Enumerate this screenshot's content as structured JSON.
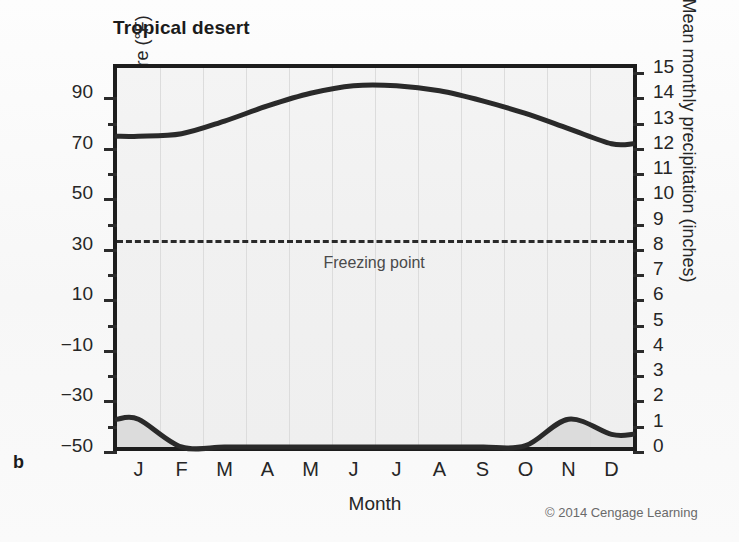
{
  "figure": {
    "panel_label": "b",
    "title": "Tropical desert",
    "copyright": "© 2014 Cengage Learning",
    "freezing_label": "Freezing point"
  },
  "chart_data": {
    "type": "line",
    "title": "Tropical desert",
    "xlabel": "Month",
    "ylabel": "Mean monthly temperature (°F)",
    "ylabel_right": "Mean monthly precipitation (inches)",
    "categories": [
      "J",
      "F",
      "M",
      "A",
      "M",
      "J",
      "J",
      "A",
      "S",
      "O",
      "N",
      "D"
    ],
    "month_names": [
      "January",
      "February",
      "March",
      "April",
      "May",
      "June",
      "July",
      "August",
      "September",
      "October",
      "November",
      "December"
    ],
    "ylim": [
      -50,
      100
    ],
    "yticks_left": [
      90,
      70,
      50,
      30,
      10,
      -10,
      -30,
      -50
    ],
    "yticks_left_all": [
      90,
      80,
      70,
      60,
      50,
      40,
      30,
      20,
      10,
      0,
      -10,
      -20,
      -30,
      -40,
      -50
    ],
    "ylim_right": [
      0,
      15
    ],
    "yticks_right": [
      15,
      14,
      13,
      12,
      11,
      10,
      9,
      8,
      7,
      6,
      5,
      4,
      3,
      2,
      1,
      0
    ],
    "grid": "vertical",
    "legend": "none",
    "annotations": [
      {
        "text": "Freezing point",
        "value": 32,
        "axis": "left",
        "style": "dashed-line"
      }
    ],
    "series": [
      {
        "name": "Mean monthly temperature",
        "axis": "left",
        "units": "°F",
        "values": [
          73,
          74,
          79,
          85,
          90,
          93,
          93,
          91,
          87,
          82,
          76,
          70
        ]
      },
      {
        "name": "Mean monthly precipitation",
        "axis": "right",
        "units": "inches",
        "values": [
          1.1,
          0.0,
          0.0,
          0.0,
          0.0,
          0.0,
          0.0,
          0.0,
          0.0,
          0.05,
          1.1,
          0.5
        ]
      }
    ]
  },
  "colors": {
    "curve": "#2a2a2a",
    "axis": "#1d1d1d",
    "grid": "#dcdcdc",
    "plot_background": "#f1f1f1",
    "text": "#262626"
  }
}
